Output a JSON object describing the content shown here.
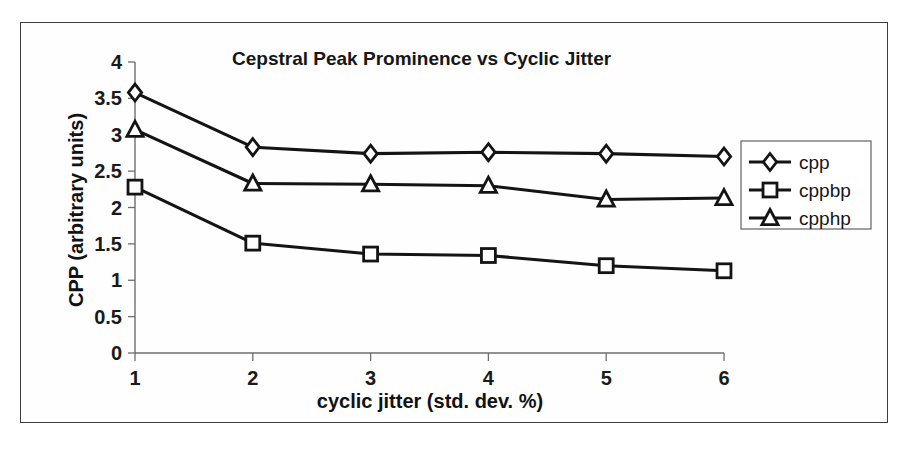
{
  "chart_data": {
    "type": "line",
    "title": "Cepstral Peak Prominence vs Cyclic Jitter",
    "xlabel": "cyclic jitter (std. dev. %)",
    "ylabel": "CPP (arbitrary units)",
    "x": [
      1,
      2,
      3,
      4,
      5,
      6
    ],
    "xticklabels": [
      "1",
      "2",
      "3",
      "4",
      "5",
      "6"
    ],
    "yticklabels": [
      "0",
      "0.5",
      "1",
      "1.5",
      "2",
      "2.5",
      "3",
      "3.5",
      "4"
    ],
    "yticks": [
      0,
      0.5,
      1,
      1.5,
      2,
      2.5,
      3,
      3.5,
      4
    ],
    "xlim": [
      1,
      6
    ],
    "ylim": [
      0,
      4
    ],
    "grid": false,
    "legend_position": "right",
    "series": [
      {
        "name": "cpp",
        "marker": "diamond",
        "values": [
          3.58,
          2.83,
          2.74,
          2.76,
          2.74,
          2.7
        ]
      },
      {
        "name": "cppbp",
        "marker": "square",
        "values": [
          2.28,
          1.51,
          1.36,
          1.34,
          1.2,
          1.13
        ]
      },
      {
        "name": "cpphp",
        "marker": "triangle",
        "values": [
          3.07,
          2.33,
          2.32,
          2.3,
          2.11,
          2.13
        ]
      }
    ]
  },
  "legend": {
    "entries": [
      {
        "label": "cpp",
        "marker": "diamond"
      },
      {
        "label": "cppbp",
        "marker": "square"
      },
      {
        "label": "cpphp",
        "marker": "triangle"
      }
    ]
  },
  "colors": {
    "line": "#141414",
    "marker_fill": "#ffffff",
    "axis": "#6e6e6e",
    "frame": "#3d3d3d",
    "background": "#ffffff"
  }
}
